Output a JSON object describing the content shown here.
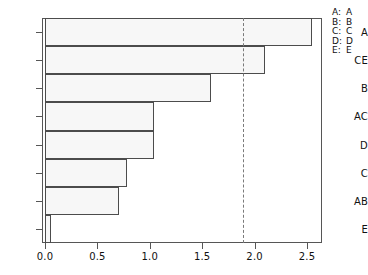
{
  "chart_data": {
    "type": "bar",
    "orientation": "horizontal",
    "title": "",
    "xlabel": "",
    "ylabel": "",
    "categories": [
      "A",
      "CE",
      "B",
      "AC",
      "D",
      "C",
      "AB",
      "E"
    ],
    "values": [
      2.55,
      2.1,
      1.58,
      1.04,
      1.04,
      0.78,
      0.71,
      0.06
    ],
    "xlim": [
      0.0,
      2.64
    ],
    "xticks": [
      0.0,
      0.5,
      1.0,
      1.5,
      2.0,
      2.5
    ],
    "xtick_labels": [
      "0.0",
      "0.5",
      "1.0",
      "1.5",
      "2.0",
      "2.5"
    ],
    "ytick_labels": [
      "A",
      "CE",
      "B",
      "AC",
      "D",
      "C",
      "AB",
      "E"
    ],
    "grid": false,
    "legend_position": "right",
    "reference_line": {
      "value": 1.89,
      "style": "dashed",
      "orientation": "vertical"
    },
    "bar_fill_color": "#f7f7f7",
    "bar_border_color": "#4c4c4c",
    "axis_color": "#565656",
    "reference_line_color": "#7a7a7a"
  },
  "legend": {
    "entries": [
      {
        "key": "A:",
        "value": "A"
      },
      {
        "key": "B:",
        "value": "B"
      },
      {
        "key": "C:",
        "value": "C"
      },
      {
        "key": "D:",
        "value": "D"
      },
      {
        "key": "E:",
        "value": "E"
      }
    ]
  }
}
